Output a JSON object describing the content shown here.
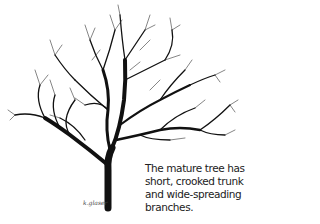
{
  "illustration": {
    "subject": "tree-silhouette",
    "signature": "k.glaser"
  },
  "caption": {
    "lines": [
      "The mature tree has a",
      "short, crooked trunk",
      "and wide-spreading",
      "branches."
    ]
  }
}
